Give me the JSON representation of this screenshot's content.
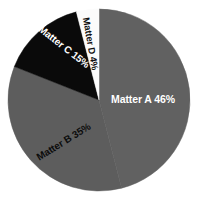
{
  "chart_data": {
    "type": "pie",
    "title": "",
    "subtitle": "",
    "xlabel": "",
    "ylabel": "",
    "grid": false,
    "legend": "none",
    "labels_on_slices": true,
    "start_angle_deg": 0,
    "direction": "clockwise",
    "categories": [
      "Matter A",
      "Matter B",
      "Matter C",
      "Matter D"
    ],
    "values": [
      46,
      35,
      15,
      4
    ],
    "units": "%",
    "slices": [
      {
        "name": "Matter A",
        "value": 46,
        "label": "Matter A 46%",
        "color": "#616161",
        "text_color": "#ffffff",
        "rotation_deg": 0,
        "start_deg": 0,
        "end_deg": 165.6
      },
      {
        "name": "Matter B",
        "value": 35,
        "label": "Matter B 35%",
        "color": "#5d5d5d",
        "text_color": "#0c0c0c",
        "rotation_deg": -32,
        "start_deg": 165.6,
        "end_deg": 291.6
      },
      {
        "name": "Matter C",
        "value": 15,
        "label": "Matter C 15%",
        "color": "#0a0a0a",
        "text_color": "#ffffff",
        "rotation_deg": 38,
        "start_deg": 291.6,
        "end_deg": 345.6
      },
      {
        "name": "Matter D",
        "value": 4,
        "label": "Matter D 4%",
        "color": "#fbfbfb",
        "text_color": "#101010",
        "rotation_deg": 80,
        "start_deg": 345.6,
        "end_deg": 360
      }
    ],
    "geometry": {
      "center_x": 99,
      "center_y": 100,
      "radius": 91
    },
    "background_color": "#ffffff"
  }
}
